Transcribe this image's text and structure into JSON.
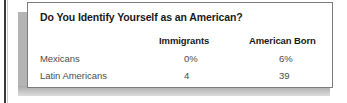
{
  "table": {
    "title": "Do You Identify Yourself as an American?",
    "columns": [
      "",
      "Immigrants",
      "American Born"
    ],
    "rows": [
      {
        "label": "Mexicans",
        "immigrants": "0%",
        "american_born": "6%"
      },
      {
        "label": "Latin Americans",
        "immigrants": "4",
        "american_born": "39"
      }
    ]
  },
  "chart_data": {
    "type": "table",
    "title": "Do You Identify Yourself as an American?",
    "categories": [
      "Mexicans",
      "Latin Americans"
    ],
    "columns": [
      "Immigrants",
      "American Born"
    ],
    "series": [
      {
        "name": "Immigrants",
        "values": [
          0,
          4
        ]
      },
      {
        "name": "American Born",
        "values": [
          6,
          39
        ]
      }
    ],
    "cell_text": [
      [
        "0%",
        "6%"
      ],
      [
        "4",
        "39"
      ]
    ],
    "xlabel": "",
    "ylabel": "",
    "units": "percent"
  },
  "colors": {
    "card_background": "#ffffff",
    "card_border": "#7d7d7d",
    "shadow": "#b4b4b4",
    "title_text": "#1a1a1a",
    "body_text": "#4d4d4d",
    "page_rule": "#3a3a3a"
  }
}
